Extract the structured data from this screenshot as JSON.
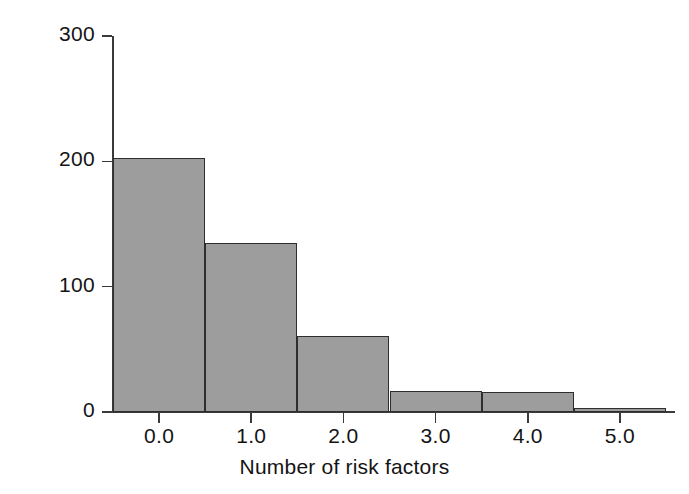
{
  "chart_data": {
    "type": "bar",
    "title": "",
    "subtitle": "",
    "xlabel": "Number of risk factors",
    "ylabel": "Outcome variable",
    "categories": [
      "0.0",
      "1.0",
      "2.0",
      "3.0",
      "4.0",
      "5.0"
    ],
    "values": [
      203,
      135,
      61,
      17,
      16,
      3
    ],
    "x": [
      0,
      1,
      2,
      3,
      4,
      5
    ],
    "bin_edges": [
      -0.5,
      0.5,
      1.5,
      2.5,
      3.5,
      4.5,
      5.5
    ],
    "bin_width": 1.0,
    "xlim": [
      -0.5,
      5.5
    ],
    "ylim": [
      0,
      300
    ],
    "xticks": [
      "0.0",
      "1.0",
      "2.0",
      "3.0",
      "4.0",
      "5.0"
    ],
    "yticks": [
      "0",
      "100",
      "200",
      "300"
    ],
    "ytick_values": [
      0,
      100,
      200,
      300
    ],
    "grid": false,
    "legend": false,
    "legend_position": "none",
    "bar_fill_color": "#9d9d9d",
    "bar_edge_color": "#2e2e2e",
    "background_color": "#ffffff",
    "axis_color": "#3a3a3a",
    "text_color": "#141414",
    "annotations": []
  },
  "figure": {
    "x_axis_title": "Number of risk factors",
    "y_axis_title": "Outcome variable"
  }
}
